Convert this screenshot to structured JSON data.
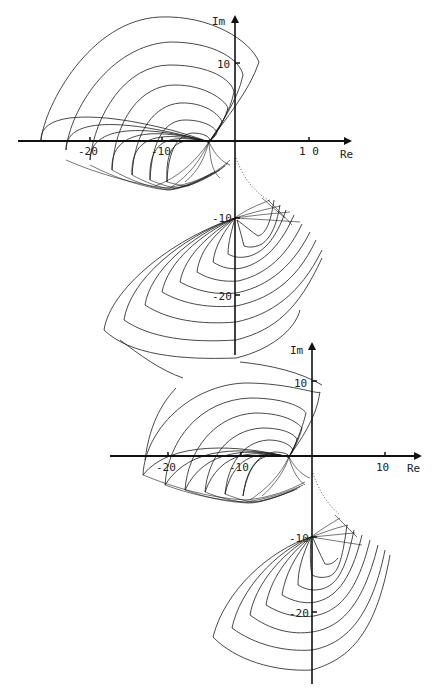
{
  "figure": {
    "line_color": "#1a1a1a",
    "background": "#ffffff"
  },
  "plots": [
    {
      "id": "upper",
      "axes": {
        "x_label": "Re",
        "y_label": "Im",
        "x_ticks": [
          {
            "value": -20,
            "label": "-20"
          },
          {
            "value": -10,
            "label": "-10"
          },
          {
            "value": 10,
            "label": "1 0"
          }
        ],
        "y_ticks": [
          {
            "value": 10,
            "label": "10"
          },
          {
            "value": -10,
            "label": "-10"
          },
          {
            "value": -20,
            "label": "-20"
          }
        ]
      }
    },
    {
      "id": "lower",
      "axes": {
        "x_label": "Re",
        "y_label": "Im",
        "x_ticks": [
          {
            "value": -20,
            "label": "-20"
          },
          {
            "value": -10,
            "label": "-10"
          },
          {
            "value": 10,
            "label": "10"
          }
        ],
        "y_ticks": [
          {
            "value": 10,
            "label": "10"
          },
          {
            "value": -10,
            "label": "-10"
          },
          {
            "value": -20,
            "label": "-20"
          }
        ]
      }
    }
  ]
}
